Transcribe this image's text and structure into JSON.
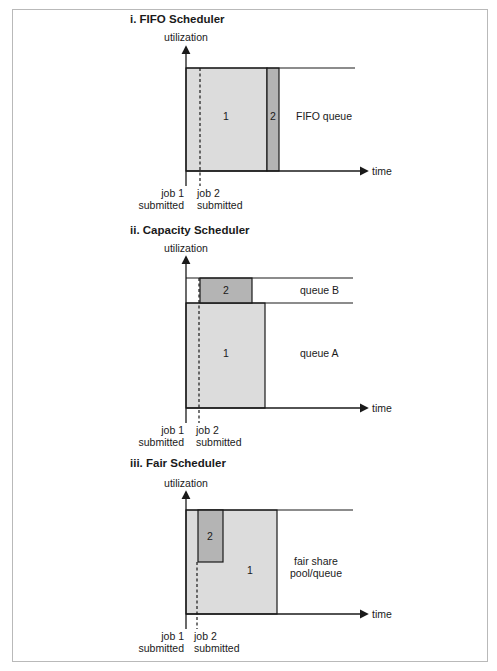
{
  "colors": {
    "job1_fill": "#dcdcdc",
    "job2_fill": "#b4b4b4",
    "line": "#1a1a1a",
    "frame": "#b9b9b9"
  },
  "panels": [
    {
      "title": "i. FIFO Scheduler",
      "y_axis_label": "utilization",
      "x_axis_label": "time",
      "job1_label": "1",
      "job2_label": "2",
      "queue_label": "FIFO queue",
      "job1_submitted": [
        "job 1",
        "submitted"
      ],
      "job2_submitted": [
        "job 2",
        "submitted"
      ]
    },
    {
      "title": "ii. Capacity Scheduler",
      "y_axis_label": "utilization",
      "x_axis_label": "time",
      "job1_label": "1",
      "job2_label": "2",
      "queue_b_label": "queue B",
      "queue_a_label": "queue A",
      "job1_submitted": [
        "job 1",
        "submitted"
      ],
      "job2_submitted": [
        "job 2",
        "submitted"
      ]
    },
    {
      "title": "iii. Fair Scheduler",
      "y_axis_label": "utilization",
      "x_axis_label": "time",
      "job1_label": "1",
      "job2_label": "2",
      "queue_label": [
        "fair share",
        "pool/queue"
      ],
      "job1_submitted": [
        "job 1",
        "submitted"
      ],
      "job2_submitted": [
        "job 2",
        "submitted"
      ]
    }
  ]
}
